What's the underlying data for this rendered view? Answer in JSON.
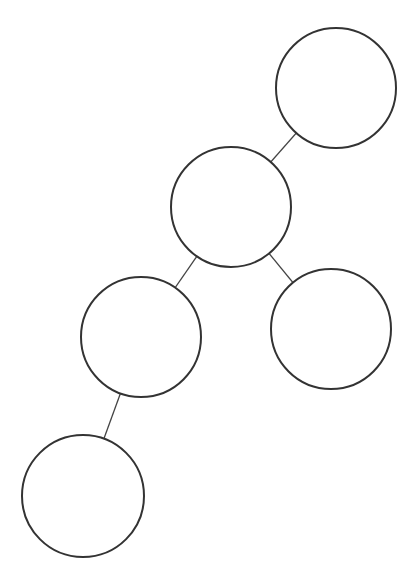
{
  "diagram": {
    "type": "tree",
    "stroke_color": "#333333",
    "background": "#ffffff",
    "nodes": [
      {
        "id": "n1",
        "cx": 336,
        "cy": 88,
        "r": 60,
        "label": ""
      },
      {
        "id": "n2",
        "cx": 231,
        "cy": 207,
        "r": 60,
        "label": ""
      },
      {
        "id": "n3",
        "cx": 141,
        "cy": 337,
        "r": 60,
        "label": ""
      },
      {
        "id": "n4",
        "cx": 331,
        "cy": 329,
        "r": 60,
        "label": ""
      },
      {
        "id": "n5",
        "cx": 83,
        "cy": 496,
        "r": 61,
        "label": ""
      }
    ],
    "edges": [
      {
        "from": "n1",
        "to": "n2"
      },
      {
        "from": "n2",
        "to": "n3"
      },
      {
        "from": "n2",
        "to": "n4"
      },
      {
        "from": "n3",
        "to": "n5"
      }
    ]
  }
}
